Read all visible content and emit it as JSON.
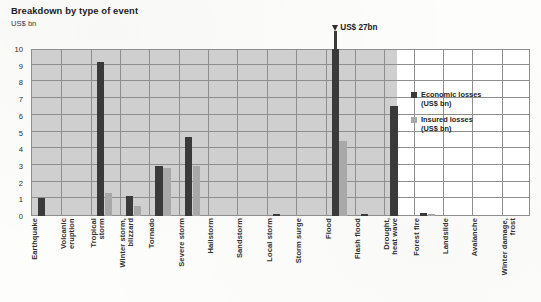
{
  "header": {
    "title": "Breakdown by type of event",
    "unit_label": "US$ bn"
  },
  "legend": {
    "position": "inside-right",
    "items": [
      {
        "label": "Economic losses\n(US$ bn)",
        "color": "#3a3a3a",
        "name": "economic-losses"
      },
      {
        "label": "Insured losses\n(US$ bn)",
        "color": "#a8a8a8",
        "name": "insured-losses"
      }
    ]
  },
  "annotations": [
    {
      "text": "US$ 27bn",
      "target_category": "Flood",
      "series": "Economic losses (US$ bn)",
      "kind": "overflow-arrow"
    }
  ],
  "axis": {
    "y_ticks": [
      "0",
      "1",
      "2",
      "3",
      "4",
      "5",
      "6",
      "7",
      "8",
      "9",
      "10"
    ]
  },
  "chart_data": {
    "type": "bar",
    "title": "Breakdown by type of event",
    "subtitle": "US$ bn",
    "xlabel": "",
    "ylabel": "US$ bn",
    "ylim": [
      0,
      10
    ],
    "grid": true,
    "legend_position": "inside-right",
    "categories": [
      "Earthquake",
      "Volcanic\neruption",
      "Tropical\nstorm",
      "Winter storm,\nblizzard",
      "Tornado",
      "Severe storm",
      "Hailstorm",
      "Sandstorm",
      "Local storm",
      "Storm surge",
      "Flood",
      "Flash flood",
      "Drought,\nheat wave",
      "Forest fire",
      "Landslide",
      "Avalanche",
      "Winter damage,\nfrost"
    ],
    "series": [
      {
        "name": "Economic losses (US$ bn)",
        "color": "#3a3a3a",
        "values": [
          1.1,
          0,
          9.2,
          1.2,
          3.0,
          4.75,
          0,
          0,
          0.15,
          0,
          27,
          0.15,
          6.6,
          0.2,
          0,
          0,
          0
        ]
      },
      {
        "name": "Insured losses (US$ bn)",
        "color": "#a8a8a8",
        "values": [
          0,
          0,
          1.4,
          0.6,
          2.85,
          3.0,
          0,
          0,
          0,
          0,
          4.5,
          0,
          0,
          0.1,
          0,
          0,
          0
        ]
      }
    ],
    "notes": [
      "Flood economic losses bar exceeds the axis maximum and is annotated US$ 27bn with an upward arrow."
    ]
  }
}
